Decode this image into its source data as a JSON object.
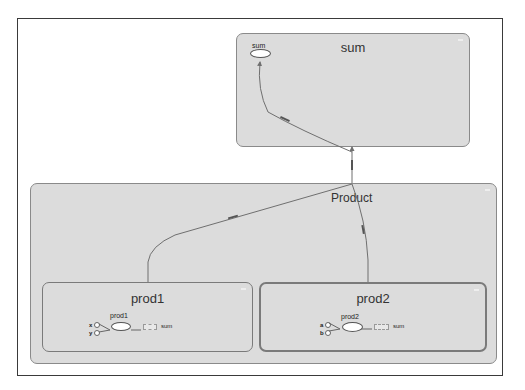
{
  "diagram": {
    "type": "computation-graph",
    "groups": {
      "sum": {
        "title": "sum",
        "node": {
          "label": "sum"
        }
      },
      "product": {
        "title": "Product"
      },
      "prod1": {
        "title": "prod1",
        "node": {
          "label": "prod1"
        },
        "inputs": [
          "x",
          "y"
        ],
        "output": "sum"
      },
      "prod2": {
        "title": "prod2",
        "node": {
          "label": "prod2"
        },
        "inputs": [
          "a",
          "b"
        ],
        "output": "sum"
      }
    },
    "edges": [
      {
        "from": "prod1",
        "to": "sum"
      },
      {
        "from": "prod2",
        "to": "sum"
      },
      {
        "from": "Product",
        "to": "sum"
      }
    ],
    "colors": {
      "group_fill": "#dcdcdc",
      "group_border": "#8a8a8a",
      "edge": "#6f6f6f",
      "frame": "#3a3a3a"
    }
  }
}
